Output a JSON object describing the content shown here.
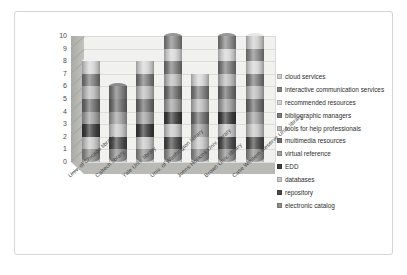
{
  "chart_data": {
    "type": "bar",
    "subtype": "stacked-cylinder-3d",
    "title": "",
    "xlabel": "",
    "ylabel": "",
    "ylim": [
      0,
      10
    ],
    "yticks": [
      "0",
      "1",
      "2",
      "3",
      "4",
      "5",
      "6",
      "7",
      "8",
      "9",
      "10"
    ],
    "grid": true,
    "legend_position": "right",
    "categories": [
      "Univ. of Chicago library",
      "Caltech library",
      "Yale Univ. library",
      "Univ. of Washington library",
      "Johns Hopkins Univ. library",
      "Brown Univ. library",
      "Case Western Reserve Univ. library"
    ],
    "series": [
      {
        "name": "electronic catalog",
        "color": "#8e8e8e",
        "values": [
          1,
          1,
          1,
          1,
          1,
          1,
          1
        ]
      },
      {
        "name": "repository",
        "color": "#4a4a4a",
        "values": [
          0,
          1,
          0,
          1,
          0,
          1,
          1
        ]
      },
      {
        "name": "databases",
        "color": "#c8c8c8",
        "values": [
          1,
          1,
          1,
          1,
          1,
          1,
          1
        ]
      },
      {
        "name": "EDD",
        "color": "#3d3d3d",
        "values": [
          1,
          0,
          1,
          1,
          0,
          1,
          0
        ]
      },
      {
        "name": "virtual reference",
        "color": "#a0a0a0",
        "values": [
          1,
          1,
          1,
          1,
          1,
          1,
          1
        ]
      },
      {
        "name": "multimedia resources",
        "color": "#6f6f6f",
        "values": [
          1,
          1,
          1,
          1,
          1,
          1,
          1
        ]
      },
      {
        "name": "tools for help professionals",
        "color": "#bdbdbd",
        "values": [
          1,
          0,
          1,
          1,
          1,
          1,
          1
        ]
      },
      {
        "name": "bibliographic managers",
        "color": "#7c7c7c",
        "values": [
          1,
          1,
          1,
          1,
          1,
          1,
          1
        ]
      },
      {
        "name": "recommended resources",
        "color": "#d6d6d6",
        "values": [
          1,
          0,
          1,
          1,
          1,
          1,
          1
        ]
      },
      {
        "name": "interactive communication services",
        "color": "#878787",
        "values": [
          0,
          0,
          0,
          1,
          0,
          1,
          1
        ]
      },
      {
        "name": "cloud services",
        "color": "#cfcfcf",
        "values": [
          0,
          0,
          0,
          0,
          0,
          0,
          1
        ]
      }
    ],
    "totals": [
      8,
      6,
      8,
      10,
      7,
      10,
      10
    ]
  },
  "legend": {
    "items": [
      {
        "label": "cloud services",
        "color": "#cfcfcf"
      },
      {
        "label": "interactive communication services",
        "color": "#878787"
      },
      {
        "label": "recommended resources",
        "color": "#d6d6d6"
      },
      {
        "label": "bibliographic managers",
        "color": "#7c7c7c"
      },
      {
        "label": "tools for help professionals",
        "color": "#bdbdbd"
      },
      {
        "label": "multimedia resources",
        "color": "#6f6f6f"
      },
      {
        "label": "virtual reference",
        "color": "#a0a0a0"
      },
      {
        "label": "EDD",
        "color": "#3d3d3d"
      },
      {
        "label": "databases",
        "color": "#c8c8c8"
      },
      {
        "label": "repository",
        "color": "#4a4a4a"
      },
      {
        "label": "electronic catalog",
        "color": "#8e8e8e"
      }
    ]
  }
}
